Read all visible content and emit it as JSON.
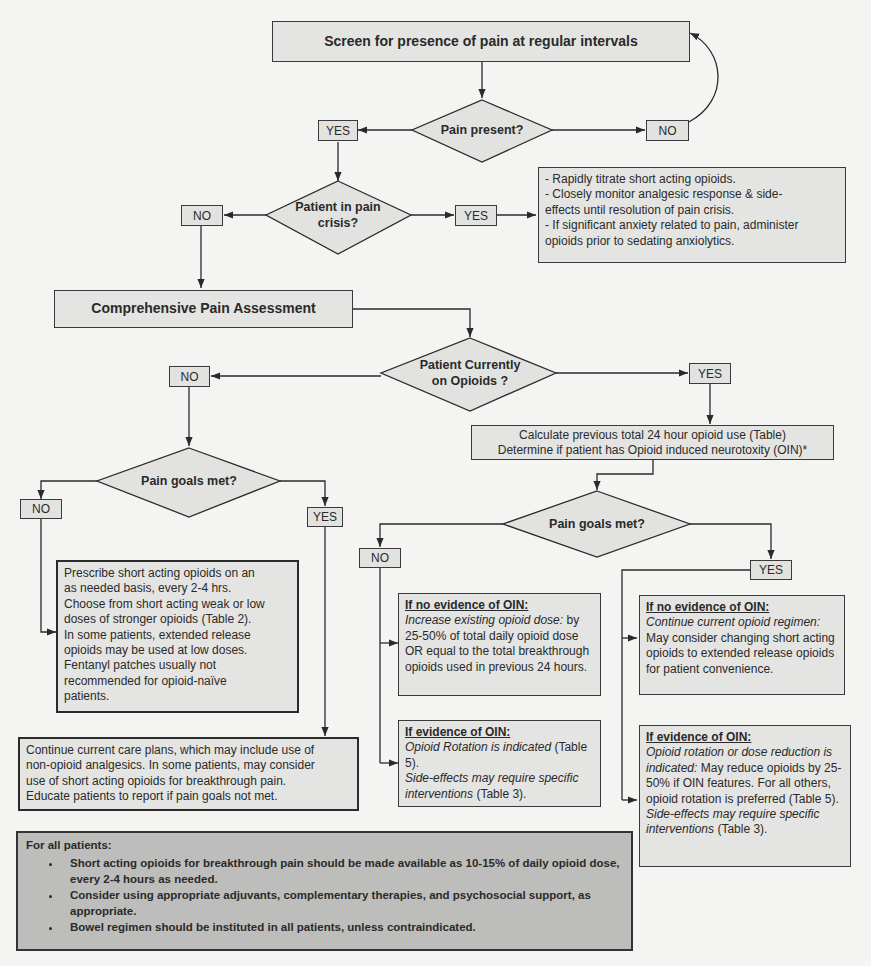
{
  "flowchart": {
    "start": {
      "text": "Screen for presence of pain at regular intervals"
    },
    "decision_pain_present": {
      "text": "Pain present?",
      "yes": "YES",
      "no": "NO"
    },
    "decision_pain_crisis": {
      "line1": "Patient in pain",
      "line2": "crisis?",
      "yes": "YES",
      "no": "NO"
    },
    "crisis_actions": {
      "lines": [
        "- Rapidly titrate short acting opioids.",
        "- Closely monitor analgesic response & side-",
        "effects until resolution of pain crisis.",
        "- If significant anxiety related to pain, administer",
        "opioids prior to sedating anxiolytics."
      ]
    },
    "assessment": {
      "text": "Comprehensive Pain Assessment"
    },
    "decision_on_opioids": {
      "line1": "Patient Currently",
      "line2": "on Opioids ?",
      "yes": "YES",
      "no": "NO"
    },
    "calculate_box": {
      "line1": "Calculate previous total 24 hour opioid use (Table)",
      "line2": "Determine if patient has Opioid induced neurotoxity (OIN)*"
    },
    "naive_branch": {
      "decision": {
        "text": "Pain goals met?",
        "yes": "YES",
        "no": "NO"
      },
      "not_met_box": {
        "lines": [
          "Prescribe short acting opioids on an",
          "as needed basis, every 2-4 hrs.",
          "Choose from short acting weak or low",
          "doses of stronger opioids (Table 2).",
          "In some patients,  extended release",
          "opioids may be used at low doses.",
          "Fentanyl patches usually not",
          "recommended for opioid-naïve",
          "patients."
        ]
      },
      "met_box": {
        "lines": [
          "Continue current care plans, which may include use of",
          "non-opioid analgesics. In some patients, may consider",
          "use of short acting opioids for breakthrough pain.",
          "Educate patients to report if pain goals not met."
        ]
      }
    },
    "opioid_branch": {
      "decision": {
        "text": "Pain goals met?",
        "yes": "YES",
        "no": "NO"
      },
      "no_no_oin": {
        "heading": "If no evidence of OIN:",
        "italic": "Increase existing opioid dose:",
        "rest": "by 25-50% of total daily opioid dose OR equal to the total breakthrough opioids used in previous 24 hours."
      },
      "no_oin": {
        "heading": "If evidence of OIN:",
        "italic1": "Opioid Rotation is indicated",
        "rest1": "(Table 5).",
        "italic2": "Side-effects may require specific interventions",
        "rest2": "(Table 3)."
      },
      "yes_no_oin": {
        "heading": "If no evidence of OIN:",
        "italic": "Continue current opioid regimen:",
        "rest": "May consider changing short acting opioids  to extended release opioids for patient convenience."
      },
      "yes_oin": {
        "heading": "If evidence of OIN:",
        "italic1": "Opioid rotation or dose reduction is indicated:",
        "rest1": "May reduce opioids by 25-50% if OIN features. For all others, opioid rotation is preferred (Table 5).",
        "italic2": "Side-effects may require specific interventions",
        "rest2": "(Table 3)."
      }
    },
    "footer": {
      "heading": "For all patients:",
      "bullets": [
        "Short acting opioids for breakthrough pain should be made available as 10-15% of daily opioid dose, every 2-4 hours as needed.",
        "Consider using appropriate adjuvants, complementary therapies, and psychosocial support, as appropriate.",
        "Bowel regimen should be instituted in all patients, unless contraindicated."
      ]
    }
  },
  "colors": {
    "background": "#f4f4f2",
    "box_fill": "#e4e4e2",
    "footer_fill": "#bdbdbb",
    "line": "#2a2a2a"
  }
}
